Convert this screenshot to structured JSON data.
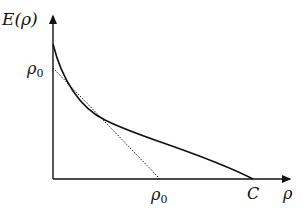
{
  "diagram": {
    "y_axis_label": "E(ρ)",
    "x_axis_label": "ρ",
    "y_tick_label": "ρ",
    "y_tick_sub": "0",
    "x_tick_label": "ρ",
    "x_tick_sub": "0",
    "x_end_label": "C",
    "curve": "convex decreasing E(ρ) from E(0) > ρ0 to 0 at ρ = C",
    "tangent": "dotted tangent line from (0, ρ0) to (ρ0, 0)",
    "colors": {
      "line": "#111111",
      "background": "#ffffff"
    }
  }
}
